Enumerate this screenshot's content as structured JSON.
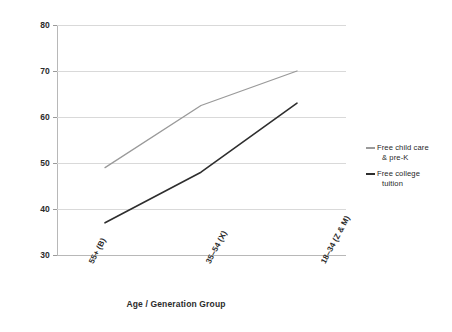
{
  "chart_data": {
    "type": "line",
    "title": "",
    "xlabel": "Age / Generation Group",
    "ylabel": "",
    "categories": [
      "55+ (B)",
      "35–54 (X)",
      "18–34 (Z & M)"
    ],
    "ylim": [
      30,
      80
    ],
    "yticks": [
      30,
      40,
      50,
      60,
      70,
      80
    ],
    "grid": true,
    "legend_position": "right",
    "series": [
      {
        "name": "Free child care & pre-K",
        "name_line1": "Free child care",
        "name_line2": "& pre-K",
        "color": "#9a9a9a",
        "values": [
          49,
          62.5,
          70
        ]
      },
      {
        "name": "Free college tuition",
        "name_line1": "Free college",
        "name_line2": "tuition",
        "color": "#2e2e2e",
        "values": [
          37,
          48,
          63
        ]
      }
    ]
  },
  "axis": {
    "y_tick_labels": [
      "80",
      "70",
      "60",
      "50",
      "40",
      "30"
    ],
    "x_tick_labels": [
      "55+ (B)",
      "35–54 (X)",
      "18–34 (Z & M)"
    ],
    "x_axis_title": "Age / Generation Group"
  },
  "legend": {
    "items": [
      {
        "line1": "Free child care",
        "line2": "& pre-K",
        "color": "#9a9a9a"
      },
      {
        "line1": "Free college",
        "line2": "tuition",
        "color": "#2e2e2e"
      }
    ]
  }
}
